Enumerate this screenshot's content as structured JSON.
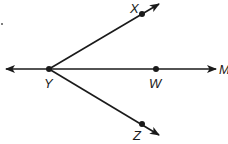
{
  "diagram": {
    "type": "geometry-rays",
    "stroke_color": "#1a1a1a",
    "background": "#ffffff",
    "vertex": {
      "name": "Y",
      "label": "Y",
      "x": 49,
      "y": 69
    },
    "points": [
      {
        "name": "X",
        "label": "X",
        "x": 142,
        "y": 14
      },
      {
        "name": "W",
        "label": "W",
        "x": 156,
        "y": 69
      },
      {
        "name": "Z",
        "label": "Z",
        "x": 142,
        "y": 124
      }
    ],
    "line_end_label": "M",
    "rays": [
      {
        "from": "Y",
        "through": "X",
        "arrow": "end"
      },
      {
        "from": "Y",
        "through": "Z",
        "arrow": "end"
      },
      {
        "from": "Y",
        "through": "W",
        "arrow": "end",
        "end_label": "M"
      },
      {
        "from": "Y",
        "direction": "left",
        "arrow": "end"
      }
    ],
    "labels": {
      "X": "X",
      "Y": "Y",
      "W": "W",
      "Z": "Z",
      "M": "M"
    }
  }
}
